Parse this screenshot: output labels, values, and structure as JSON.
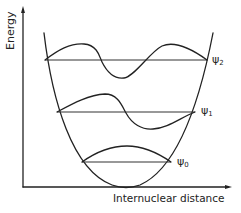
{
  "diagram": {
    "title": "",
    "axes": {
      "y_label": "Energy",
      "x_label": "Internuclear distance"
    },
    "potential": "harmonic-potential-well",
    "levels": [
      {
        "id": "psi0",
        "symbol": "ψ",
        "subscript": "0",
        "nodes": 0
      },
      {
        "id": "psi1",
        "symbol": "ψ",
        "subscript": "1",
        "nodes": 1
      },
      {
        "id": "psi2",
        "symbol": "ψ",
        "subscript": "2",
        "nodes": 2
      }
    ],
    "colors": {
      "ink": "#222222",
      "background": "#ffffff"
    }
  }
}
